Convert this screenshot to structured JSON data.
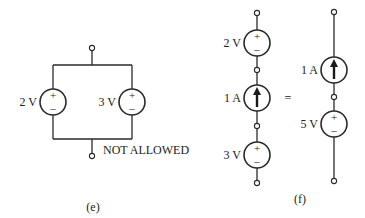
{
  "figure_e": {
    "caption": "(e)",
    "note": "NOT ALLOWED",
    "sources": [
      {
        "type": "voltage",
        "label": "2 V",
        "plus": "+",
        "minus": "–"
      },
      {
        "type": "voltage",
        "label": "3 V",
        "plus": "+",
        "minus": "–"
      }
    ]
  },
  "figure_f": {
    "caption": "(f)",
    "equals": "=",
    "left_chain": [
      {
        "type": "voltage",
        "label": "2 V",
        "plus": "+",
        "minus": "–"
      },
      {
        "type": "current",
        "label": "1 A",
        "direction": "up"
      },
      {
        "type": "voltage",
        "label": "3 V",
        "plus": "+",
        "minus": "–"
      }
    ],
    "right_chain": [
      {
        "type": "current",
        "label": "1 A",
        "direction": "up"
      },
      {
        "type": "voltage",
        "label": "5 V",
        "plus": "+",
        "minus": "–"
      }
    ]
  }
}
